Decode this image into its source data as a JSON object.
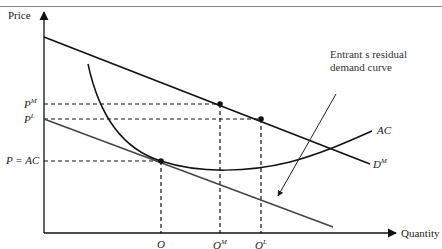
{
  "diagram": {
    "type": "economics-limit-pricing",
    "axes": {
      "y_label": "Price",
      "x_label": "Quantity"
    },
    "price_labels": [
      {
        "base": "P",
        "sup": "M",
        "y": 104
      },
      {
        "base": "P",
        "sup": "L",
        "y": 119
      },
      {
        "base": "P = AC",
        "sup": "",
        "y": 161
      }
    ],
    "quantity_labels": [
      {
        "base": "O",
        "sup": "",
        "x": 161
      },
      {
        "base": "O",
        "sup": "M",
        "x": 220
      },
      {
        "base": "O",
        "sup": "L",
        "x": 261
      }
    ],
    "curve_labels": {
      "market_demand": {
        "base": "D",
        "sup": "M"
      },
      "average_cost": "AC",
      "annotation": [
        "Entrant s residual",
        "demand curve"
      ]
    },
    "points": [
      {
        "name": "monopoly",
        "x": 220,
        "y": 104
      },
      {
        "name": "limit",
        "x": 261,
        "y": 119
      },
      {
        "name": "tangency",
        "x": 161,
        "y": 161
      }
    ],
    "colors": {
      "line": "#111111",
      "residual": "#444444",
      "text": "#222222"
    }
  }
}
